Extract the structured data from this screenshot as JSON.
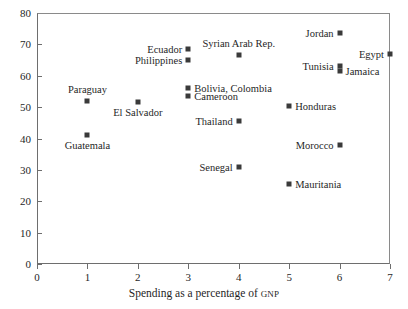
{
  "chart_data": {
    "type": "scatter",
    "title": "",
    "xlabel": "Spending as a percentage of GNP",
    "xlabel_main": "Spending as a percentage of ",
    "xlabel_smallcaps": "GNP",
    "ylabel": "",
    "xlim": [
      0,
      7
    ],
    "ylim": [
      0,
      80
    ],
    "xticks": [
      0,
      1,
      2,
      3,
      4,
      5,
      6,
      7
    ],
    "yticks": [
      0,
      10,
      20,
      30,
      40,
      50,
      60,
      70,
      80
    ],
    "grid": false,
    "legend": "none",
    "marker_color": "#3a3a3a",
    "points": [
      {
        "label": "Paraguay",
        "x": 1.0,
        "y": 52.0,
        "label_pos": "above"
      },
      {
        "label": "Guatemala",
        "x": 1.0,
        "y": 41.0,
        "label_pos": "below"
      },
      {
        "label": "El Salvador",
        "x": 2.0,
        "y": 51.5,
        "label_pos": "below"
      },
      {
        "label": "Ecuador",
        "x": 3.0,
        "y": 68.5,
        "label_pos": "left"
      },
      {
        "label": "Philippines",
        "x": 3.0,
        "y": 65.0,
        "label_pos": "left"
      },
      {
        "label": "Bolivia, Colombia",
        "x": 3.0,
        "y": 56.0,
        "label_pos": "right"
      },
      {
        "label": "Cameroon",
        "x": 3.0,
        "y": 53.5,
        "label_pos": "right"
      },
      {
        "label": "Syrian Arab Rep.",
        "x": 4.0,
        "y": 66.5,
        "label_pos": "above"
      },
      {
        "label": "Thailand",
        "x": 4.0,
        "y": 45.5,
        "label_pos": "left"
      },
      {
        "label": "Senegal",
        "x": 4.0,
        "y": 31.0,
        "label_pos": "left"
      },
      {
        "label": "Honduras",
        "x": 5.0,
        "y": 50.5,
        "label_pos": "right"
      },
      {
        "label": "Mauritania",
        "x": 5.0,
        "y": 25.5,
        "label_pos": "right"
      },
      {
        "label": "Jordan",
        "x": 6.0,
        "y": 73.5,
        "label_pos": "left"
      },
      {
        "label": "Tunisia",
        "x": 6.0,
        "y": 63.0,
        "label_pos": "left"
      },
      {
        "label": "Jamaica",
        "x": 6.0,
        "y": 61.5,
        "label_pos": "right"
      },
      {
        "label": "Morocco",
        "x": 6.0,
        "y": 38.0,
        "label_pos": "left"
      },
      {
        "label": "Egypt",
        "x": 7.0,
        "y": 67.0,
        "label_pos": "left"
      }
    ]
  }
}
